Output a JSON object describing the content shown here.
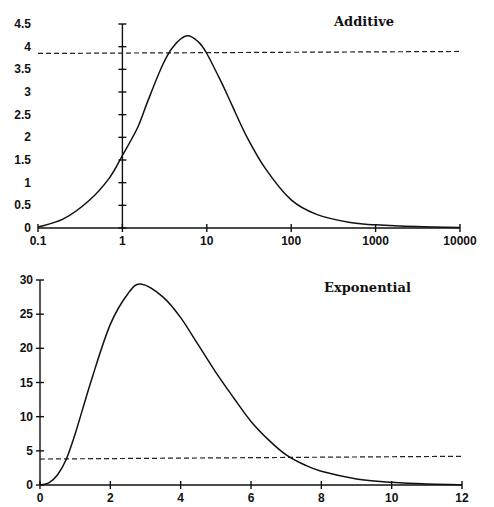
{
  "chart_data": [
    {
      "type": "line",
      "title": "Additive",
      "xlabel": "",
      "ylabel": "",
      "xscale": "log",
      "xlim": [
        0.1,
        10000
      ],
      "ylim": [
        0,
        4.5
      ],
      "x_ticks": [
        "0.1",
        "1",
        "10",
        "100",
        "1000",
        "10000"
      ],
      "y_ticks": [
        "0",
        "0.5",
        "1",
        "1.5",
        "2",
        "2.5",
        "3",
        "3.5",
        "4",
        "4.5"
      ],
      "grid": false,
      "y_axis_crosses_at_x": 1,
      "reference_line": {
        "style": "dashed",
        "y": 3.85,
        "x_range": [
          0.1,
          10000
        ]
      },
      "series": [
        {
          "name": "Additive",
          "x": [
            0.1,
            0.2,
            0.4,
            0.7,
            1,
            1.5,
            2,
            3,
            4,
            5.8,
            8,
            10,
            15,
            20,
            30,
            50,
            100,
            200,
            500,
            1000,
            3000,
            10000
          ],
          "y": [
            0.02,
            0.2,
            0.6,
            1.1,
            1.6,
            2.2,
            2.8,
            3.6,
            4.0,
            4.24,
            4.1,
            3.85,
            3.2,
            2.7,
            2.0,
            1.3,
            0.62,
            0.3,
            0.12,
            0.07,
            0.03,
            0.01
          ]
        }
      ]
    },
    {
      "type": "line",
      "title": "Exponential",
      "xlabel": "",
      "ylabel": "",
      "xscale": "linear",
      "xlim": [
        0,
        12
      ],
      "ylim": [
        0,
        30
      ],
      "x_ticks": [
        "0",
        "2",
        "4",
        "6",
        "8",
        "10",
        "12"
      ],
      "y_ticks": [
        "0",
        "5",
        "10",
        "15",
        "20",
        "25",
        "30"
      ],
      "grid": false,
      "reference_line": {
        "style": "dashed",
        "y_start": 3.8,
        "y_end": 4.2,
        "x_range": [
          0,
          12
        ]
      },
      "series": [
        {
          "name": "Exponential",
          "x": [
            0,
            0.25,
            0.5,
            0.75,
            1,
            1.5,
            2,
            2.5,
            2.87,
            3.5,
            4,
            4.5,
            5,
            5.5,
            6,
            6.5,
            7,
            7.5,
            8,
            9,
            10,
            11,
            12
          ],
          "y": [
            0,
            0.3,
            1.5,
            3.8,
            7.5,
            16,
            23.5,
            28,
            29.4,
            27.5,
            24.5,
            20.5,
            16.5,
            12.8,
            9.3,
            6.6,
            4.4,
            3.0,
            2.0,
            0.9,
            0.4,
            0.15,
            0.05
          ]
        }
      ]
    }
  ],
  "labels": {
    "top_title": "Additive",
    "bottom_title": "Exponential"
  }
}
